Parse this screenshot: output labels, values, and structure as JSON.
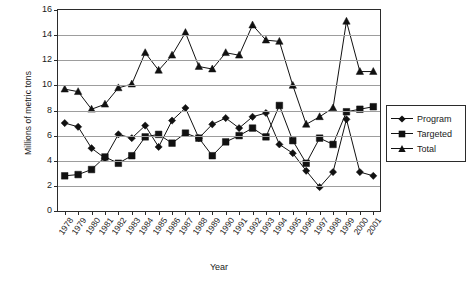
{
  "chart_data": {
    "type": "line",
    "title": "",
    "xlabel": "Year",
    "ylabel": "Millions of metric tons",
    "categories": [
      "1978",
      "1979",
      "1980",
      "1981",
      "1982",
      "1983",
      "1984",
      "1985",
      "1986",
      "1987",
      "1988",
      "1989",
      "1990",
      "1991",
      "1992",
      "1993",
      "1994",
      "1995",
      "1996",
      "1997",
      "1998",
      "1999",
      "2000",
      "2001"
    ],
    "ylim": [
      0,
      16
    ],
    "yticks": [
      0,
      2,
      4,
      6,
      8,
      10,
      12,
      14,
      16
    ],
    "grid": true,
    "legend_position": "right",
    "series": [
      {
        "name": "Program",
        "marker": "diamond",
        "values": [
          7.0,
          6.7,
          5.0,
          4.2,
          6.1,
          5.8,
          6.8,
          5.1,
          7.2,
          8.2,
          5.8,
          6.9,
          7.4,
          6.6,
          7.5,
          7.8,
          5.3,
          4.6,
          3.2,
          1.9,
          3.1,
          7.3,
          3.1,
          2.8
        ]
      },
      {
        "name": "Targeted",
        "marker": "square",
        "values": [
          2.8,
          2.9,
          3.3,
          4.3,
          3.8,
          4.4,
          5.9,
          6.1,
          5.4,
          6.2,
          5.8,
          4.4,
          5.5,
          6.0,
          6.6,
          5.9,
          8.4,
          5.6,
          3.8,
          5.8,
          5.3,
          7.9,
          8.1,
          8.3
        ]
      },
      {
        "name": "Total",
        "marker": "triangle",
        "values": [
          9.7,
          9.5,
          8.1,
          8.5,
          9.8,
          10.1,
          12.6,
          11.2,
          12.4,
          14.2,
          11.5,
          11.3,
          12.6,
          12.4,
          14.8,
          13.6,
          13.5,
          10.0,
          6.9,
          7.5,
          8.2,
          15.1,
          11.1,
          11.1
        ]
      }
    ]
  },
  "legend": {
    "items": [
      {
        "label": "Program",
        "marker": "diamond"
      },
      {
        "label": "Targeted",
        "marker": "square"
      },
      {
        "label": "Total",
        "marker": "triangle"
      }
    ]
  }
}
